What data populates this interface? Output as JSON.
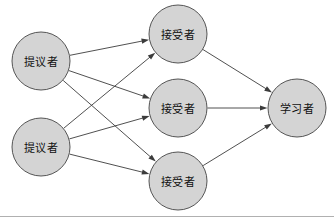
{
  "diagram": {
    "type": "node-link-graph",
    "canvas": {
      "width": 334,
      "height": 217,
      "background": "#ffffff"
    },
    "style": {
      "node_fill": "#d4d4d4",
      "node_stroke": "#555555",
      "edge_stroke": "#3c3c3c",
      "arrow_fill": "#3c3c3c",
      "label_color": "#101010",
      "frame_stroke": "#b0b0b0",
      "node_radius": 29
    },
    "columns": [
      {
        "name": "proposers",
        "role_label": "提议者",
        "count": 2
      },
      {
        "name": "acceptors",
        "role_label": "接受者",
        "count": 3
      },
      {
        "name": "learners",
        "role_label": "学习者",
        "count": 1
      }
    ],
    "nodes": [
      {
        "id": "proposer-1",
        "label": "提议者",
        "role": "proposer",
        "cx": 41,
        "cy": 61,
        "r": 29
      },
      {
        "id": "proposer-2",
        "label": "提议者",
        "role": "proposer",
        "cx": 41,
        "cy": 147,
        "r": 29
      },
      {
        "id": "acceptor-1",
        "label": "接受者",
        "role": "acceptor",
        "cx": 178,
        "cy": 34,
        "r": 29
      },
      {
        "id": "acceptor-2",
        "label": "接受者",
        "role": "acceptor",
        "cx": 178,
        "cy": 108,
        "r": 29
      },
      {
        "id": "acceptor-3",
        "label": "接受者",
        "role": "acceptor",
        "cx": 178,
        "cy": 181,
        "r": 29
      },
      {
        "id": "learner-1",
        "label": "学习者",
        "role": "learner",
        "cx": 297,
        "cy": 108,
        "r": 29
      }
    ],
    "edges": [
      {
        "id": "e1",
        "from": "proposer-1",
        "to": "acceptor-1",
        "directed": true
      },
      {
        "id": "e2",
        "from": "proposer-1",
        "to": "acceptor-2",
        "directed": true
      },
      {
        "id": "e3",
        "from": "proposer-1",
        "to": "acceptor-3",
        "directed": true
      },
      {
        "id": "e4",
        "from": "proposer-2",
        "to": "acceptor-1",
        "directed": true
      },
      {
        "id": "e5",
        "from": "proposer-2",
        "to": "acceptor-2",
        "directed": true
      },
      {
        "id": "e6",
        "from": "proposer-2",
        "to": "acceptor-3",
        "directed": true
      },
      {
        "id": "e7",
        "from": "acceptor-1",
        "to": "learner-1",
        "directed": true
      },
      {
        "id": "e8",
        "from": "acceptor-2",
        "to": "learner-1",
        "directed": true
      },
      {
        "id": "e9",
        "from": "acceptor-3",
        "to": "learner-1",
        "directed": true
      }
    ],
    "frame": {
      "bottom_border": true
    }
  }
}
